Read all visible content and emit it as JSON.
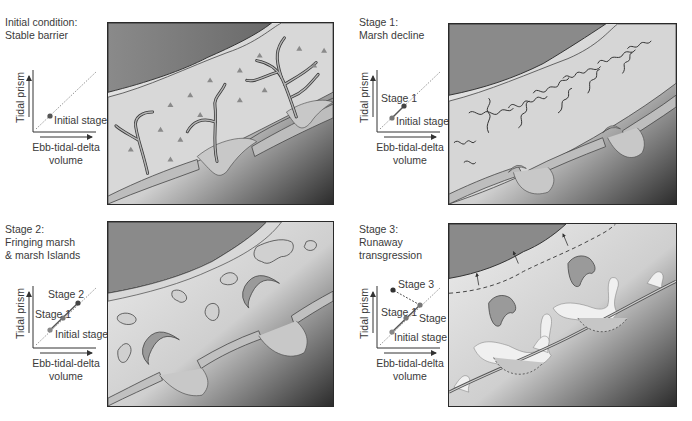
{
  "colors": {
    "land": "#8a8a8a",
    "lagoon_light": "#d4d4d4",
    "ocean_dark": "#3a3a3a",
    "marsh": "#cfcfcf",
    "channel": "#b9b9b9",
    "stage_point": "#555555",
    "axis": "#333333"
  },
  "stages": [
    {
      "title": "Initial condition:\nStable barrier",
      "inset": {
        "ylabel": "Tidal prism",
        "xlabel": "Ebb-tidal-delta\nvolume",
        "points": [
          {
            "label": "Initial stage"
          }
        ]
      },
      "panel_caption": "Stable barrier with extensive marsh and tidal creeks"
    },
    {
      "title": "Stage 1:\nMarsh decline",
      "inset": {
        "ylabel": "Tidal prism",
        "xlabel": "Ebb-tidal-delta\nvolume",
        "points": [
          {
            "label": "Stage 1"
          },
          {
            "label": "Initial stage"
          }
        ]
      },
      "panel_caption": "Marsh fragmentation and channel widening"
    },
    {
      "title": "Stage 2:\nFringing marsh\n& marsh Islands",
      "inset": {
        "ylabel": "Tidal prism",
        "xlabel": "Ebb-tidal-delta\nvolume",
        "points": [
          {
            "label": "Stage 2"
          },
          {
            "label": "Stage 1"
          },
          {
            "label": "Initial stage"
          }
        ]
      },
      "panel_caption": "Open lagoon with fringing marsh and marsh islands"
    },
    {
      "title": "Stage 3:\nRunaway\ntransgression",
      "inset": {
        "ylabel": "Tidal prism",
        "xlabel": "Ebb-tidal-delta\nvolume",
        "points": [
          {
            "label": "Stage 3"
          },
          {
            "label": "Stage 1"
          },
          {
            "label": "Stage 2"
          },
          {
            "label": "Initial stage"
          }
        ]
      },
      "panel_caption": "Barrier overwash and landward migration"
    }
  ]
}
